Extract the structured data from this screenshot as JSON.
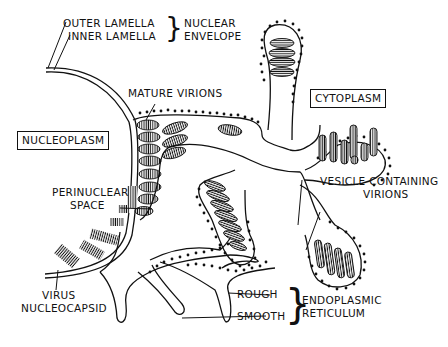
{
  "diagram": {
    "labels": {
      "outer_lamella": "OUTER LAMELLA",
      "inner_lamella": "INNER LAMELLA",
      "nuclear_envelope_1": "NUCLEAR",
      "nuclear_envelope_2": "ENVELOPE",
      "mature_virions": "MATURE VIRIONS",
      "cytoplasm": "CYTOPLASM",
      "nucleoplasm": "NUCLEOPLASM",
      "perinuclear_1": "PERINUCLEAR",
      "perinuclear_2": "SPACE",
      "vesicle_1": "VESICLE CONTAINING",
      "vesicle_2": "VIRIONS",
      "virus_1": "VIRUS",
      "virus_2": "NUCLEOCAPSID",
      "rough": "ROUGH",
      "smooth": "SMOOTH",
      "er_1": "ENDOPLASMIC",
      "er_2": "RETICULUM"
    },
    "colors": {
      "ink": "#111111",
      "background": "#ffffff"
    }
  }
}
